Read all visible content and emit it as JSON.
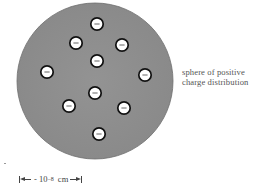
{
  "sphere": {
    "label_line1": "sphere of positive",
    "label_line2": "charge distribution",
    "fill_color": "#8f8f8f",
    "edge_color": "#6a6a6a"
  },
  "electrons": {
    "count": 10,
    "symbol": "−",
    "fill_color": "#ffffff",
    "outline_color": "#111111",
    "items": [
      {
        "name": "top"
      },
      {
        "name": "upper-left"
      },
      {
        "name": "upper-right"
      },
      {
        "name": "center-upper"
      },
      {
        "name": "left"
      },
      {
        "name": "right"
      },
      {
        "name": "center-lower"
      },
      {
        "name": "lower-left"
      },
      {
        "name": "lower-right"
      },
      {
        "name": "bottom"
      }
    ]
  },
  "scale": {
    "prefix": "- 10",
    "exponent": "−8",
    "unit": "cm"
  }
}
